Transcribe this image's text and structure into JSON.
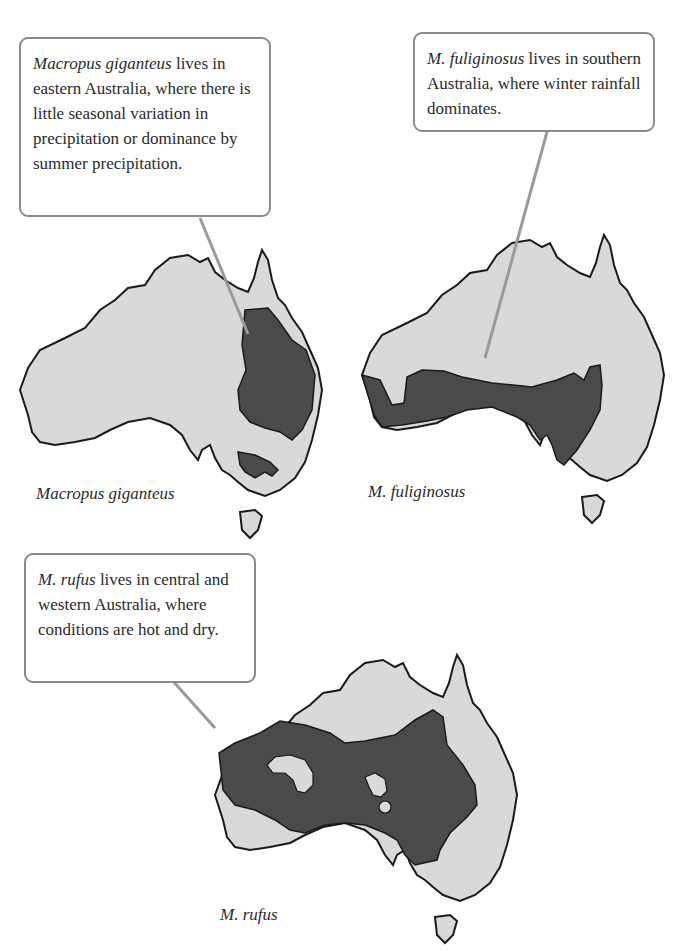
{
  "figure": {
    "type": "species range maps",
    "colors": {
      "land": "#d9d9d9",
      "range": "#4a4a4a",
      "outline": "#1a1a1a",
      "callout_border": "#8a8a8a",
      "leader_line": "#9a9a9a"
    },
    "panels": [
      {
        "species_label": "Macropus giganteus",
        "callout": {
          "species": "Macropus giganteus",
          "text": " lives in eastern Australia, where there is little seasonal variation in precipitation or dominance by summer precipitation."
        },
        "range_description": "eastern Australia (Queensland/NSW coast inland) plus patch in Victoria"
      },
      {
        "species_label": "M. fuliginosus",
        "callout": {
          "species": "M. fuliginosus",
          "text": " lives in southern Australia, where winter rainfall dominates."
        },
        "range_description": "southern band from Western Australia to western NSW/Victoria"
      },
      {
        "species_label": "M. rufus",
        "callout": {
          "species": "M. rufus",
          "text": " lives in central and western Australia, where conditions are hot and dry."
        },
        "range_description": "central and western Australia with small gaps"
      }
    ]
  }
}
